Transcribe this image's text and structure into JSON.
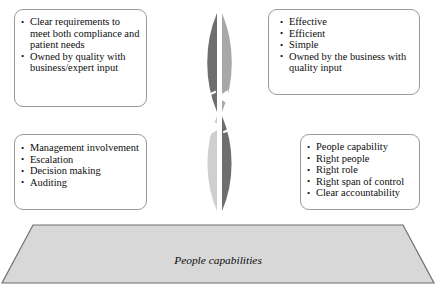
{
  "diagram": {
    "colors": {
      "quadrant_dark": "#6e6e6e",
      "quadrant_mid": "#a8a8a8",
      "quadrant_light": "#cfcfcf",
      "base_fill": "#d8d8d8",
      "base_stroke": "#6f6f6f",
      "box_border": "#9a9a9a",
      "text": "#0d0d0d",
      "label_text": "#ffffff"
    },
    "quadrants": [
      {
        "id": "integrated-standards",
        "label": "Integrated\nstandards",
        "label_lines": [
          "Integrated",
          "standards"
        ],
        "position": "top-left",
        "fill": "#6e6e6e"
      },
      {
        "id": "business-processes",
        "label": "Business\nprocesses",
        "label_lines": [
          "Business",
          "processes"
        ],
        "position": "top-right",
        "fill": "#a8a8a8"
      },
      {
        "id": "governance-management-oversight",
        "label": "Governance/\nmanagement\noversight",
        "label_lines": [
          "Governance/",
          "management",
          "oversight"
        ],
        "position": "bottom-left",
        "fill": "#cfcfcf"
      },
      {
        "id": "organization",
        "label": "Organization",
        "label_lines": [
          "Organization"
        ],
        "position": "bottom-right",
        "fill": "#6e6e6e"
      }
    ],
    "center_icon": "circular-rotation-arrows-icon",
    "callouts": [
      {
        "id": "integrated-standards",
        "position": "top-left",
        "items": [
          "Clear requirements to meet both compliance and patient needs",
          "Owned by quality with business/expert input"
        ]
      },
      {
        "id": "business-processes",
        "position": "top-right",
        "items": [
          "Effective",
          "Efficient",
          "Simple",
          "Owned by the business with quality input"
        ]
      },
      {
        "id": "governance-management-oversight",
        "position": "bottom-left",
        "items": [
          "Management involvement",
          "Escalation",
          "Decision making",
          "Auditing"
        ]
      },
      {
        "id": "organization",
        "position": "bottom-right",
        "items": [
          "People capability",
          "Right people",
          "Right role",
          "Right span of control",
          "Clear accountability"
        ]
      }
    ],
    "base": {
      "label": "People capabilities",
      "shape": "trapezoid"
    }
  }
}
